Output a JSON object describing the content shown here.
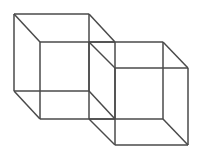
{
  "figure": {
    "background_color": "#ffffff",
    "line_color": "#4a4a4a",
    "line_width": 1.5,
    "canvas": {
      "width": 201,
      "height": 157
    },
    "shapes": [
      {
        "name": "left-cube",
        "front_face": [
          [
            40,
            42
          ],
          [
            115,
            42
          ],
          [
            115,
            119
          ],
          [
            40,
            119
          ]
        ],
        "back_face": [
          [
            14,
            14
          ],
          [
            89,
            14
          ],
          [
            89,
            91
          ],
          [
            14,
            91
          ]
        ],
        "connectors": [
          [
            [
              40,
              42
            ],
            [
              14,
              14
            ]
          ],
          [
            [
              115,
              42
            ],
            [
              89,
              14
            ]
          ],
          [
            [
              115,
              119
            ],
            [
              89,
              91
            ]
          ],
          [
            [
              40,
              119
            ],
            [
              14,
              91
            ]
          ]
        ]
      },
      {
        "name": "right-cube",
        "front_face": [
          [
            115,
            68
          ],
          [
            188,
            68
          ],
          [
            188,
            145
          ],
          [
            115,
            145
          ]
        ],
        "back_face": [
          [
            89,
            42
          ],
          [
            163,
            42
          ],
          [
            163,
            119
          ],
          [
            89,
            119
          ]
        ],
        "connectors": [
          [
            [
              115,
              68
            ],
            [
              89,
              42
            ]
          ],
          [
            [
              188,
              68
            ],
            [
              163,
              42
            ]
          ],
          [
            [
              188,
              145
            ],
            [
              163,
              119
            ]
          ],
          [
            [
              115,
              145
            ],
            [
              89,
              119
            ]
          ]
        ]
      }
    ]
  }
}
